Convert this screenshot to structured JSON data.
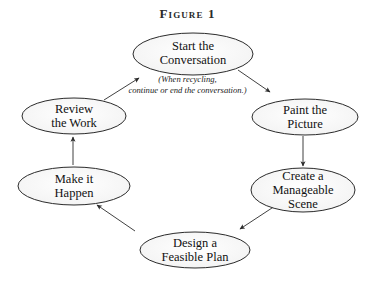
{
  "figure": {
    "title": "Figure 1",
    "background_color": "#ffffff",
    "ellipse_fill": "#fbfbfb",
    "ellipse_stroke": "#2b2b2b",
    "arrow_color": "#2b2b2b",
    "annotation": "(When recycling,\ncontinue or end the conversation.)"
  },
  "nodes": [
    {
      "id": "start-the-conversation",
      "label": "Start the\nConversation",
      "cx": 193,
      "cy": 54,
      "rx": 60,
      "ry": 21
    },
    {
      "id": "paint-the-picture",
      "label": "Paint the\nPicture",
      "cx": 305,
      "cy": 117,
      "rx": 53,
      "ry": 18
    },
    {
      "id": "create-a-manageable-scene",
      "label": "Create a\nManageable\nScene",
      "cx": 303,
      "cy": 190,
      "rx": 52,
      "ry": 22
    },
    {
      "id": "design-a-feasible-plan",
      "label": "Design a\nFeasible Plan",
      "cx": 195,
      "cy": 250,
      "rx": 55,
      "ry": 18
    },
    {
      "id": "make-it-happen",
      "label": "Make it\nHappen",
      "cx": 74,
      "cy": 186,
      "rx": 56,
      "ry": 19
    },
    {
      "id": "review-the-work",
      "label": "Review\nthe Work",
      "cx": 74,
      "cy": 116,
      "rx": 52,
      "ry": 18
    }
  ],
  "arrows": [
    {
      "id": "review-to-start",
      "from": "review-the-work",
      "to": "start-the-conversation",
      "x1": 104,
      "y1": 100,
      "x2": 139,
      "y2": 78
    },
    {
      "id": "start-to-paint",
      "from": "start-the-conversation",
      "to": "paint-the-picture",
      "x1": 238,
      "y1": 70,
      "x2": 270,
      "y2": 92
    },
    {
      "id": "paint-to-create",
      "from": "paint-the-picture",
      "to": "create-a-manageable-scene",
      "x1": 303,
      "y1": 136,
      "x2": 303,
      "y2": 166
    },
    {
      "id": "create-to-design",
      "from": "create-a-manageable-scene",
      "to": "design-a-feasible-plan",
      "x1": 275,
      "y1": 206,
      "x2": 240,
      "y2": 229
    },
    {
      "id": "design-to-make",
      "from": "design-a-feasible-plan",
      "to": "make-it-happen",
      "x1": 135,
      "y1": 231,
      "x2": 97,
      "y2": 205
    },
    {
      "id": "make-to-review",
      "from": "make-it-happen",
      "to": "review-the-work",
      "x1": 73,
      "y1": 165,
      "x2": 73,
      "y2": 137
    }
  ]
}
